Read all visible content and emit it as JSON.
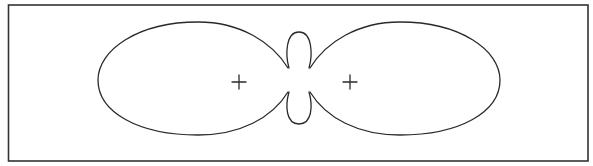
{
  "diagram": {
    "type": "polar-lobe-pattern",
    "frame": {
      "x": 8,
      "y": 5,
      "width": 580,
      "height": 156
    },
    "colors": {
      "stroke": "#2a2a2a",
      "frame": "#333333",
      "background": "#ffffff"
    },
    "lobes": [
      {
        "name": "left-major-lobe",
        "left": 98,
        "right": 288,
        "top": 22,
        "bottom": 135
      },
      {
        "name": "right-major-lobe",
        "left": 310,
        "right": 500,
        "top": 22,
        "bottom": 135
      },
      {
        "name": "upper-minor-lobe",
        "left": 288,
        "right": 310,
        "top": 32,
        "bottom": 68
      },
      {
        "name": "lower-minor-lobe",
        "left": 288,
        "right": 310,
        "top": 92,
        "bottom": 124
      }
    ],
    "markers": [
      {
        "name": "left-plus",
        "symbol": "+",
        "x": 239,
        "y": 82
      },
      {
        "name": "right-plus",
        "symbol": "+",
        "x": 350,
        "y": 82
      }
    ]
  }
}
